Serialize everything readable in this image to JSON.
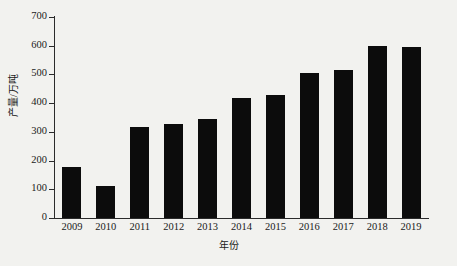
{
  "chart_data": {
    "type": "bar",
    "title": "",
    "subtitle": "",
    "xlabel": "年份",
    "ylabel": "产量/万吨",
    "categories": [
      "2009",
      "2010",
      "2011",
      "2012",
      "2013",
      "2014",
      "2015",
      "2016",
      "2017",
      "2018",
      "2019"
    ],
    "values": [
      178,
      110,
      316,
      326,
      346,
      417,
      430,
      505,
      516,
      600,
      595
    ],
    "series": [
      {
        "name": "产量",
        "values": [
          178,
          110,
          316,
          326,
          346,
          417,
          430,
          505,
          516,
          600,
          595
        ]
      }
    ],
    "ylim": [
      0,
      700
    ],
    "y_ticks": [
      0,
      100,
      200,
      300,
      400,
      500,
      600,
      700
    ],
    "y_tick_labels": [
      "0",
      "100",
      "200",
      "300",
      "400",
      "500",
      "600",
      "700"
    ],
    "grid": false,
    "legend": false,
    "legend_position": "none",
    "bar_color": "#0c0c0c",
    "axis_color": "#2b2b2b",
    "background_color": "#f2f2ef",
    "annotations": []
  }
}
